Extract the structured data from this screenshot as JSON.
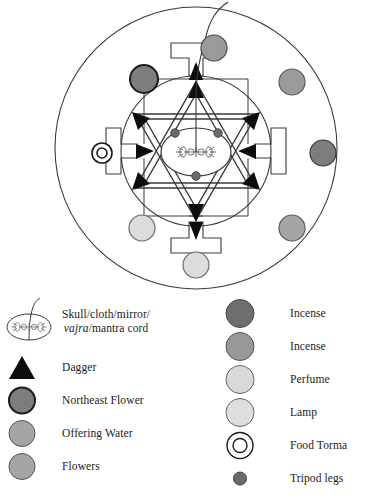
{
  "figure": {
    "name": "ritual-mandala-diagram",
    "outer_circle": {
      "cx": 196,
      "cy": 146,
      "r": 140
    },
    "inner_circle": {
      "cx": 196,
      "cy": 150,
      "r": 74
    },
    "center_ellipse": {
      "cx": 196,
      "cy": 152,
      "rx": 34,
      "ry": 23
    },
    "gates": [
      {
        "name": "north-gate",
        "direction": "north",
        "marker": "incense",
        "color": "#9a9a9a"
      },
      {
        "name": "east-gate",
        "direction": "east",
        "marker": "incense",
        "color": "#7d7d7d"
      },
      {
        "name": "south-gate",
        "direction": "south",
        "marker": "lamp",
        "color": "#dcdcdc"
      },
      {
        "name": "west-gate",
        "direction": "west",
        "marker": "food-torma",
        "color": "#ffffff"
      }
    ],
    "corner_circles": [
      {
        "name": "northwest-circle",
        "label": "Northeast Flower",
        "color": "#7d7d7d"
      },
      {
        "name": "northeast-circle",
        "label": "Offering Water",
        "color": "#9a9a9a"
      },
      {
        "name": "southwest-circle",
        "label": "Perfume",
        "color": "#dcdcdc"
      },
      {
        "name": "southeast-circle",
        "label": "Flowers",
        "color": "#a5a5a5"
      }
    ],
    "dagger_count": 6,
    "tripod_leg_count": 3,
    "mantra_cord": "curving line from central vajra through north gate"
  },
  "legend": {
    "left": [
      {
        "symbol": "vajra-ellipse",
        "label_line1": "Skull/cloth/mirror/",
        "label_italic": "vajra",
        "label_line2_rest": "/mantra cord",
        "color": "#ffffff"
      },
      {
        "symbol": "triangle",
        "label": "Dagger",
        "color": "#000000"
      },
      {
        "symbol": "circle",
        "label": "Northeast Flower",
        "color": "#7d7d7d",
        "stroke": "#1a1a1a",
        "stroke_width": 1.8
      },
      {
        "symbol": "circle",
        "label": "Offering Water",
        "color": "#a5a5a5",
        "stroke": "#555555",
        "stroke_width": 1
      },
      {
        "symbol": "circle",
        "label": "Flowers",
        "color": "#a5a5a5",
        "stroke": "#555555",
        "stroke_width": 1
      }
    ],
    "right": [
      {
        "symbol": "circle",
        "label": "Incense",
        "color": "#6e6e6e",
        "stroke": "#4a4a4a",
        "stroke_width": 1
      },
      {
        "symbol": "circle",
        "label": "Incense",
        "color": "#989898",
        "stroke": "#555555",
        "stroke_width": 1
      },
      {
        "symbol": "circle",
        "label": "Perfume",
        "color": "#d9d9d9",
        "stroke": "#666666",
        "stroke_width": 1
      },
      {
        "symbol": "circle",
        "label": "Lamp",
        "color": "#dedede",
        "stroke": "#666666",
        "stroke_width": 1
      },
      {
        "symbol": "double-ring",
        "label": "Food Torma",
        "color": "#ffffff",
        "stroke": "#1a1a1a",
        "stroke_width": 1.4
      },
      {
        "symbol": "small-circle",
        "label": "Tripod legs",
        "color": "#6b6b6b",
        "stroke": "#3a3a3a",
        "stroke_width": 1
      }
    ]
  }
}
